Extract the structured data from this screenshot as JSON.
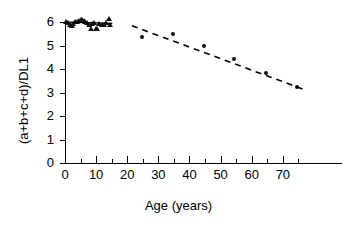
{
  "chart_data": {
    "type": "scatter",
    "title": "",
    "xlabel": "Age (years)",
    "ylabel": "(a+b+c+d)/DL1",
    "xlim": [
      0,
      89
    ],
    "ylim": [
      0,
      6.35
    ],
    "grid": false,
    "legend": "none",
    "x_ticks": [
      0,
      10,
      20,
      30,
      40,
      50,
      60,
      70
    ],
    "x_minor_ticks": [
      5,
      15,
      25,
      35,
      45,
      55,
      65,
      75
    ],
    "y_ticks": [
      0,
      1,
      2,
      3,
      4,
      5,
      6
    ],
    "series": [
      {
        "name": "Children",
        "marker": "triangle",
        "color": "#111111",
        "points": [
          {
            "x": 0.3,
            "y": 6.0
          },
          {
            "x": 1.0,
            "y": 5.97
          },
          {
            "x": 1.6,
            "y": 5.88
          },
          {
            "x": 2.1,
            "y": 5.84
          },
          {
            "x": 2.6,
            "y": 5.93
          },
          {
            "x": 3.2,
            "y": 6.02
          },
          {
            "x": 3.8,
            "y": 5.99
          },
          {
            "x": 4.4,
            "y": 6.05
          },
          {
            "x": 5.0,
            "y": 6.1
          },
          {
            "x": 5.5,
            "y": 6.08
          },
          {
            "x": 6.0,
            "y": 6.06
          },
          {
            "x": 6.5,
            "y": 6.0
          },
          {
            "x": 7.1,
            "y": 5.95
          },
          {
            "x": 7.6,
            "y": 5.9
          },
          {
            "x": 8.2,
            "y": 5.72
          },
          {
            "x": 8.8,
            "y": 5.93
          },
          {
            "x": 9.4,
            "y": 5.97
          },
          {
            "x": 9.9,
            "y": 5.7
          },
          {
            "x": 10.4,
            "y": 5.72
          },
          {
            "x": 11.0,
            "y": 5.92
          },
          {
            "x": 11.8,
            "y": 5.9
          },
          {
            "x": 12.6,
            "y": 5.88
          },
          {
            "x": 13.3,
            "y": 5.95
          },
          {
            "x": 14.0,
            "y": 6.12
          },
          {
            "x": 14.6,
            "y": 5.9
          }
        ]
      },
      {
        "name": "Adults",
        "marker": "circle",
        "color": "#111111",
        "points": [
          {
            "x": 24.8,
            "y": 5.35
          },
          {
            "x": 34.6,
            "y": 5.5
          },
          {
            "x": 44.5,
            "y": 5.0
          },
          {
            "x": 54.4,
            "y": 4.42
          },
          {
            "x": 64.6,
            "y": 3.85
          },
          {
            "x": 74.6,
            "y": 3.25
          }
        ]
      }
    ],
    "fit_lines": [
      {
        "name": "child-trend-line",
        "style": "solid",
        "x1": 0.4,
        "y1": 6.0,
        "x2": 15.2,
        "y2": 5.95
      },
      {
        "name": "adult-regression-line",
        "style": "dashed",
        "x1": 21.5,
        "y1": 5.85,
        "x2": 77.0,
        "y2": 3.12
      }
    ]
  },
  "axes": {
    "y_tick_labels": [
      "0",
      "1",
      "2",
      "3",
      "4",
      "5",
      "6"
    ],
    "x_tick_labels": [
      "0",
      "10",
      "20",
      "30",
      "40",
      "50",
      "60",
      "70"
    ]
  }
}
